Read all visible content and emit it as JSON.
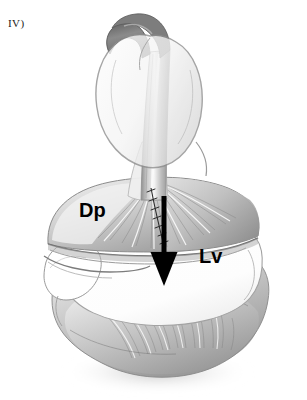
{
  "figure": {
    "panel_label": "IV)",
    "background_color": "#ffffff",
    "ink_color": "#000000",
    "medium": "grayscale pencil / airbrush medical illustration"
  },
  "labels": [
    {
      "id": "dp",
      "text": "Dp",
      "meaning": "posterior/diaphragmatic leaflet",
      "x": 79,
      "y": 200,
      "font_size": 20,
      "color": "#000000"
    },
    {
      "id": "lv",
      "text": "Lv",
      "meaning": "left ventricle",
      "x": 199,
      "y": 246,
      "font_size": 20,
      "color": "#000000"
    }
  ],
  "annotations": {
    "arrow": {
      "name": "direction-arrow",
      "color": "#000000",
      "direction": "down",
      "tail_x": 164,
      "tail_y": 196,
      "tip_x": 164,
      "tip_y": 286,
      "shaft_width": 5,
      "head_width": 27,
      "head_height": 34
    },
    "suture": {
      "name": "suture-line",
      "color": "#2b2b2b",
      "stitch_count": 7,
      "from_x": 151,
      "from_y": 188,
      "to_x": 167,
      "to_y": 246
    }
  },
  "structures": {
    "instrument": {
      "name": "hooked-instrument-shaft",
      "hook_color": "#6f6f6f",
      "shaft_color": "#b9b9b9",
      "shaft_highlight": "#f2f2f2",
      "top_y": 14,
      "bottom_y": 215
    },
    "leaflet": {
      "name": "elevated-leaflet",
      "outline_color": "#8e8e8e",
      "fill_color": "#fbfbfb",
      "center_x": 152,
      "center_y": 92,
      "width": 104,
      "height": 128
    },
    "dp_leaflet": {
      "name": "dp-leaflet-fan",
      "fill_light": "#f6f6f6",
      "fill_mid": "#cfcfcf",
      "fill_dark": "#9a9a9a",
      "striation_count": 22
    },
    "ventricle_chamber": {
      "name": "ventricle-cavity",
      "fill_color": "#ffffff",
      "rim_color": "#9d9d9d"
    },
    "myocardium": {
      "name": "trabeculated-myocardium",
      "fill_light": "#fafafa",
      "fill_mid": "#c4c4c4",
      "fill_dark": "#8a8a8a",
      "fiber_count": 34
    }
  },
  "palette": {
    "white": "#ffffff",
    "paper": "#fdfdfd",
    "light_gray": "#e8e8e8",
    "mid_gray": "#b5b5b5",
    "dark_gray": "#7d7d7d",
    "shadow_gray": "#5a5a5a",
    "black": "#000000"
  }
}
